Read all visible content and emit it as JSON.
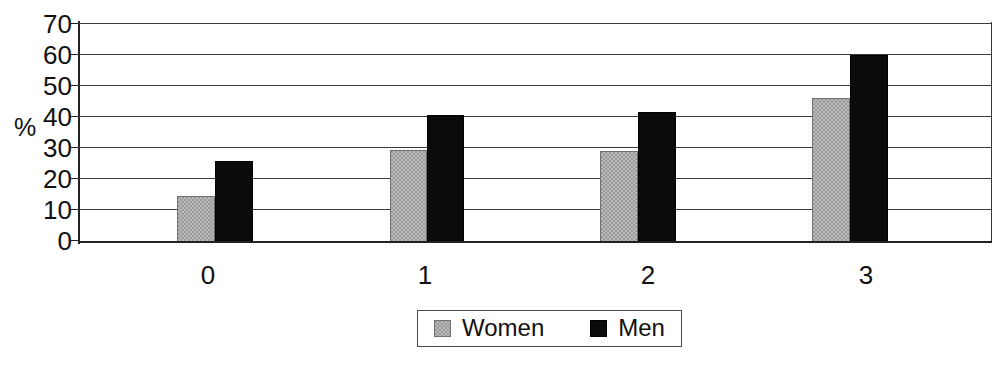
{
  "chart_data": {
    "type": "bar",
    "title": "",
    "subtitle": "",
    "xlabel": "",
    "ylabel": "%",
    "categories": [
      "0",
      "1",
      "2",
      "3"
    ],
    "series": [
      {
        "name": "Women",
        "color": "#9b9b9b",
        "values": [
          15,
          29.5,
          29,
          46
        ]
      },
      {
        "name": "Men",
        "color": "#000000",
        "values": [
          26,
          40.5,
          41.5,
          59.5
        ]
      }
    ],
    "ylim": [
      0,
      70
    ],
    "yticks": [
      0,
      10,
      20,
      30,
      40,
      50,
      60,
      70
    ],
    "ytick_labels": [
      "0",
      "10",
      "20",
      "30",
      "40",
      "50",
      "60",
      "70"
    ],
    "grid": true,
    "legend_position": "bottom-center",
    "legend_entries": [
      {
        "label": "Women",
        "swatch": "grey-square-swatch"
      },
      {
        "label": "Men",
        "swatch": "black-square-swatch"
      }
    ]
  },
  "axes": {
    "y_title": "%"
  }
}
